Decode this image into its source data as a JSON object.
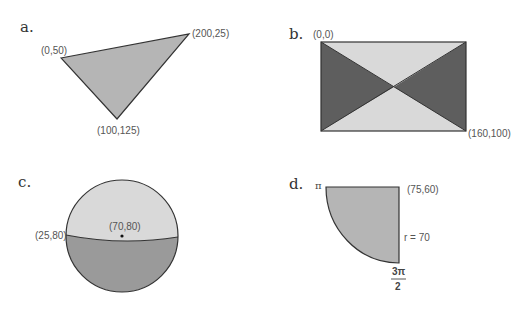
{
  "colors": {
    "background": "#ffffff",
    "stroke": "#333333",
    "medium_gray": "#b5b5b5",
    "light_gray": "#d9d9d9",
    "dark_gray": "#5e5e5e",
    "circle_bottom": "#9a9a9a",
    "text": "#555555"
  },
  "panels": {
    "a": {
      "label": "a.",
      "shape": "triangle",
      "vertices": [
        {
          "label": "(0,50)"
        },
        {
          "label": "(200,25)"
        },
        {
          "label": "(100,125)"
        }
      ]
    },
    "b": {
      "label": "b.",
      "shape": "rectangle with diagonals",
      "top_left_label": "(0,0)",
      "bottom_right_label": "(160,100)"
    },
    "c": {
      "label": "c.",
      "shape": "circle split by chord",
      "left_point_label": "(25,80)",
      "center_label": "(70,80)"
    },
    "d": {
      "label": "d.",
      "shape": "quarter circle sector",
      "angle_start_label": "π",
      "angle_end_numerator": "3π",
      "angle_end_denominator": "2",
      "corner_label": "(75,60)",
      "radius_label": "r = 70"
    }
  }
}
